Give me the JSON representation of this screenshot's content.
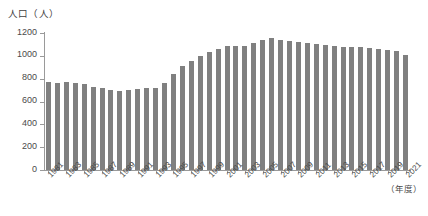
{
  "chart_data": {
    "type": "bar",
    "title": "",
    "subtitle": "",
    "xlabel": "（年度）",
    "ylabel": "人口（人）",
    "ylim": [
      0,
      1200
    ],
    "y_ticks": [
      0,
      200,
      400,
      600,
      800,
      1000,
      1200
    ],
    "y_tick_labels": [
      "0",
      "200",
      "400",
      "600",
      "800",
      "1000",
      "1200"
    ],
    "grid": false,
    "legend": null,
    "legend_position": "none",
    "bar_color": "#808080",
    "axis_color": "#9a9a9a",
    "x_tick_label_rotation": -45,
    "x_tick_label_step": 2,
    "categories": [
      "1981",
      "1982",
      "1983",
      "1984",
      "1985",
      "1986",
      "1987",
      "1988",
      "1989",
      "1990",
      "1991",
      "1992",
      "1993",
      "1994",
      "1995",
      "1996",
      "1997",
      "1998",
      "1999",
      "2000",
      "2001",
      "2002",
      "2003",
      "2004",
      "2005",
      "2006",
      "2007",
      "2008",
      "2009",
      "2010",
      "2011",
      "2012",
      "2013",
      "2014",
      "2015",
      "2016",
      "2017",
      "2018",
      "2019",
      "2020",
      "2021"
    ],
    "x_tick_labels": [
      "1981",
      "1983",
      "1985",
      "1987",
      "1989",
      "1991",
      "1993",
      "1995",
      "1997",
      "1999",
      "2001",
      "2003",
      "2005",
      "2007",
      "2009",
      "2011",
      "2013",
      "2015",
      "2017",
      "2019",
      "2021"
    ],
    "values": [
      770,
      765,
      770,
      760,
      755,
      730,
      720,
      700,
      695,
      700,
      710,
      715,
      720,
      760,
      840,
      910,
      955,
      1000,
      1035,
      1060,
      1085,
      1090,
      1090,
      1110,
      1140,
      1155,
      1140,
      1130,
      1125,
      1115,
      1100,
      1095,
      1085,
      1075,
      1080,
      1075,
      1065,
      1060,
      1050,
      1040,
      1010
    ]
  }
}
